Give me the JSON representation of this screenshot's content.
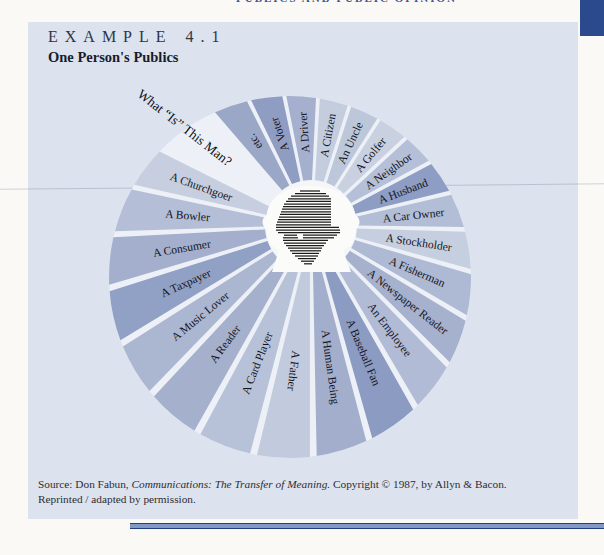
{
  "running_head": "PUBLICS AND PUBLIC OPINION",
  "example": {
    "label": "EXAMPLE 4.1",
    "title": "One Person's Publics"
  },
  "source": {
    "prefix": "Source: Don Fabun, ",
    "italic": "Communications: The Transfer of Meaning.",
    "suffix": " Copyright © 1987, by Allyn & Bacon.",
    "line2": "Reprinted / adapted by permission."
  },
  "colors": {
    "page": "#faf9f6",
    "panel": "#dce3ee",
    "corner_tab": "#2b4a8e",
    "rule_dark": "#233f7e",
    "rule_light": "#8298c5",
    "disc": "#edf1f7",
    "hub": "#f4f6f8",
    "head_fill": "#fbfbfa",
    "hatch_stroke": "#1c1c1c",
    "label_text": "#15151d"
  },
  "chart_data": {
    "type": "pie",
    "title": "One Person's Publics",
    "annotation": "What “Is” This Man?",
    "center_icon": "head-profile-icon",
    "equal_segments": true,
    "layout": {
      "start_angle_deg": 131,
      "gap_degrees": 22,
      "annotation_angle_deg": 142,
      "grid": false,
      "legend": false
    },
    "segments": [
      {
        "label": "etc.",
        "color": "#9aa7c7"
      },
      {
        "label": "A Voter",
        "color": "#8f9dc3"
      },
      {
        "label": "A Driver",
        "color": "#a5b0ce"
      },
      {
        "label": "A Citizen",
        "color": "#c4cdde"
      },
      {
        "label": "An Uncle",
        "color": "#bdc7da"
      },
      {
        "label": "A Golfer",
        "color": "#c9d1e1"
      },
      {
        "label": "A Neighbor",
        "color": "#b5c0d8"
      },
      {
        "label": "A Husband",
        "color": "#8e9dc4"
      },
      {
        "label": "A Car Owner",
        "color": "#b2bdd6"
      },
      {
        "label": "A Stockholder",
        "color": "#c6cfe0"
      },
      {
        "label": "A Fisherman",
        "color": "#aeb9d3"
      },
      {
        "label": "A Newspaper Reader",
        "color": "#a6b1ce"
      },
      {
        "label": "An Employee",
        "color": "#b1bbd5"
      },
      {
        "label": "A Baseball Fan",
        "color": "#8c9bc2"
      },
      {
        "label": "A Human Being",
        "color": "#a2aecb"
      },
      {
        "label": "A Father",
        "color": "#c2cbdd"
      },
      {
        "label": "A Card Player",
        "color": "#b7c1d8"
      },
      {
        "label": "A Reader",
        "color": "#a5b0cd"
      },
      {
        "label": "A Music Lover",
        "color": "#abb6d1"
      },
      {
        "label": "A Taxpayer",
        "color": "#91a0c5"
      },
      {
        "label": "A Consumer",
        "color": "#a3afcc"
      },
      {
        "label": "A Bowler",
        "color": "#b4bed6"
      },
      {
        "label": "A Churchgoer",
        "color": "#c6cedf"
      }
    ]
  }
}
